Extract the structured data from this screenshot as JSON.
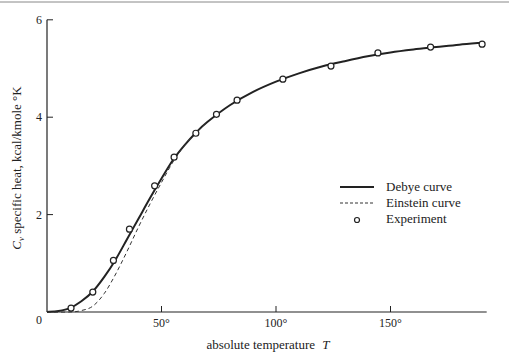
{
  "chart_data": {
    "type": "line",
    "title": "",
    "xlabel": "absolute temperature T",
    "ylabel": "C_v specific heat, kcal/kmole °K",
    "xlim": [
      0,
      192
    ],
    "ylim": [
      0,
      6
    ],
    "x_ticks": [
      {
        "value": 0,
        "label": "0"
      },
      {
        "value": 50,
        "label": "50°"
      },
      {
        "value": 100,
        "label": "100°"
      },
      {
        "value": 150,
        "label": "150°"
      }
    ],
    "y_ticks": [
      {
        "value": 0,
        "label": "0"
      },
      {
        "value": 2,
        "label": "2"
      },
      {
        "value": 4,
        "label": "4"
      },
      {
        "value": 6,
        "label": "6"
      }
    ],
    "grid": false,
    "legend_position": "center-right",
    "legend": [
      {
        "label": "Debye curve",
        "style": "solid"
      },
      {
        "label": "Einstein curve",
        "style": "dashed"
      },
      {
        "label": "Experiment",
        "style": "open-circle"
      }
    ],
    "series": [
      {
        "name": "Debye curve",
        "style": "solid",
        "x": [
          0,
          5,
          10,
          15,
          20,
          25,
          30,
          35,
          40,
          45,
          50,
          55,
          60,
          65,
          70,
          80,
          90,
          100,
          110,
          120,
          130,
          140,
          150,
          160,
          170,
          180,
          190
        ],
        "y": [
          0,
          0.02,
          0.08,
          0.22,
          0.42,
          0.72,
          1.08,
          1.5,
          1.92,
          2.34,
          2.74,
          3.12,
          3.42,
          3.68,
          3.9,
          4.25,
          4.52,
          4.73,
          4.9,
          5.04,
          5.15,
          5.25,
          5.33,
          5.39,
          5.44,
          5.49,
          5.53
        ]
      },
      {
        "name": "Einstein curve",
        "style": "dashed",
        "x": [
          0,
          10,
          15,
          20,
          25,
          30,
          35,
          40,
          45,
          50,
          55,
          60,
          65,
          70
        ],
        "y": [
          0,
          0.0,
          0.03,
          0.12,
          0.38,
          0.78,
          1.25,
          1.75,
          2.22,
          2.66,
          3.08,
          3.42,
          3.68,
          3.9
        ]
      },
      {
        "name": "Experiment",
        "style": "open-circle",
        "x": [
          10.5,
          20,
          29,
          36,
          47,
          55.5,
          65,
          74,
          83,
          103,
          124,
          144.5,
          167.5,
          190
        ],
        "y": [
          0.08,
          0.41,
          1.06,
          1.7,
          2.59,
          3.18,
          3.67,
          4.06,
          4.35,
          4.78,
          5.05,
          5.32,
          5.44,
          5.5
        ]
      }
    ]
  },
  "labels": {
    "xlabel_prefix": "absolute temperature",
    "xlabel_var": "T",
    "ylabel_var": "C",
    "ylabel_sub": "v",
    "ylabel_rest": " specific heat, kcal/kmole °K"
  }
}
